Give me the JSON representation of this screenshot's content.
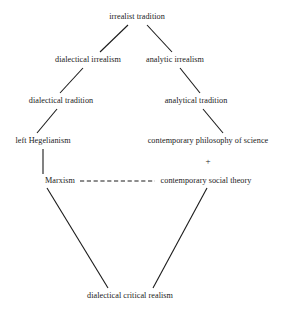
{
  "diagram": {
    "background_color": "#ffffff",
    "line_color": "#1a1a1a",
    "text_color": "#1a1a1a",
    "nodes": [
      {
        "id": "irrealist-tradition",
        "label": "irrealist tradition",
        "x": 137,
        "y": 17
      },
      {
        "id": "dialectical-irrealism",
        "label": "dialectical irrealism",
        "x": 88,
        "y": 60
      },
      {
        "id": "analytic-irrealism",
        "label": "analytic irrealism",
        "x": 175,
        "y": 60
      },
      {
        "id": "dialectical-tradition",
        "label": "dialectical tradition",
        "x": 61,
        "y": 101
      },
      {
        "id": "analytical-tradition",
        "label": "analytical tradition",
        "x": 196,
        "y": 101
      },
      {
        "id": "left-hegelianism",
        "label": "left Hegelianism",
        "x": 43,
        "y": 141
      },
      {
        "id": "contemporary-philosophy-of-science",
        "label": "contemporary philosophy of science",
        "x": 208,
        "y": 141
      },
      {
        "id": "marxism",
        "label": "Marxism",
        "x": 60,
        "y": 181
      },
      {
        "id": "contemporary-social-theory",
        "label": "contemporary social theory",
        "x": 206,
        "y": 181
      },
      {
        "id": "dialectical-critical-realism",
        "label": "dialectical critical realism",
        "x": 130,
        "y": 296
      }
    ],
    "plus_symbol": {
      "label": "+",
      "x": 208,
      "y": 161
    },
    "edges": [
      {
        "id": "irrealist-to-dialectical-irrealism",
        "style": "solid",
        "x1": 128,
        "y1": 25,
        "x2": 100,
        "y2": 52
      },
      {
        "id": "irrealist-to-analytic-irrealism",
        "style": "solid",
        "x1": 147,
        "y1": 25,
        "x2": 172,
        "y2": 52
      },
      {
        "id": "dialectical-irrealism-to-tradition",
        "style": "solid",
        "x1": 83,
        "y1": 68,
        "x2": 60,
        "y2": 93
      },
      {
        "id": "analytic-irrealism-to-analytical-tradition",
        "style": "solid",
        "x1": 180,
        "y1": 68,
        "x2": 200,
        "y2": 93
      },
      {
        "id": "dialectical-tradition-to-left-hegelianism",
        "style": "solid",
        "x1": 57,
        "y1": 109,
        "x2": 37,
        "y2": 133
      },
      {
        "id": "analytical-tradition-to-contemporary-philosophy",
        "style": "solid",
        "x1": 203,
        "y1": 109,
        "x2": 223,
        "y2": 133
      },
      {
        "id": "left-hegelianism-to-marxism",
        "style": "solid",
        "x1": 43,
        "y1": 149,
        "x2": 43,
        "y2": 174
      },
      {
        "id": "marxism-to-contemporary-social-theory",
        "style": "dashed",
        "x1": 80,
        "y1": 181,
        "x2": 155,
        "y2": 181
      },
      {
        "id": "marxism-to-dialectical-critical-realism",
        "style": "solid",
        "x1": 47,
        "y1": 188,
        "x2": 108,
        "y2": 288
      },
      {
        "id": "contemporary-social-theory-to-dialectical-critical-realism",
        "style": "solid",
        "x1": 207,
        "y1": 188,
        "x2": 153,
        "y2": 288
      }
    ]
  }
}
